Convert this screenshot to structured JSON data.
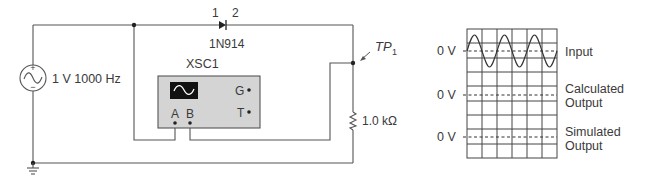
{
  "circuit": {
    "source": {
      "label": "1 V 1000 Hz",
      "plus": "+",
      "minus": "−"
    },
    "diode": {
      "pin1": "1",
      "pin2": "2",
      "part": "1N914"
    },
    "oscilloscope": {
      "name": "XSC1",
      "pin_a": "A",
      "pin_b": "B",
      "pin_g": "G",
      "pin_t": "T"
    },
    "test_point": {
      "label": "TP",
      "subscript": "1"
    },
    "resistor": {
      "label": "1.0 kΩ"
    }
  },
  "traces": {
    "rows": [
      {
        "zero_label": "0 V",
        "label_line1": "Input",
        "label_line2": ""
      },
      {
        "zero_label": "0 V",
        "label_line1": "Calculated",
        "label_line2": "Output"
      },
      {
        "zero_label": "0 V",
        "label_line1": "Simulated",
        "label_line2": "Output"
      }
    ]
  },
  "colors": {
    "wire": "#555555",
    "scope_body": "#d4d4d4",
    "scope_screen": "#111111"
  }
}
